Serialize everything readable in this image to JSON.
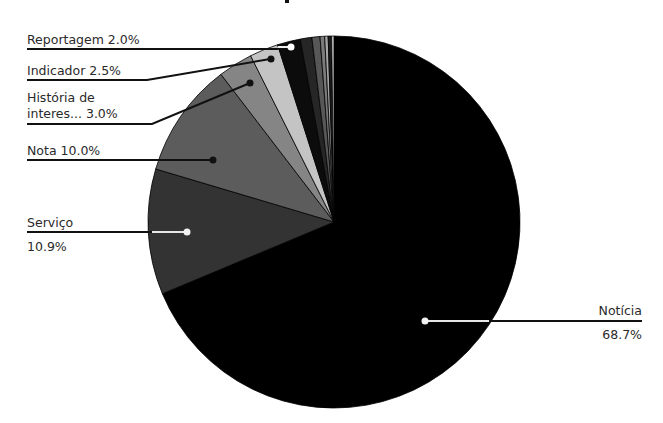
{
  "chart_data": {
    "type": "pie",
    "title": "",
    "start_angle_deg": 0,
    "direction": "clockwise",
    "center": [
      334,
      222
    ],
    "radius": 186,
    "slices": [
      {
        "label": "Notícia",
        "value": 68.7,
        "display": "68.7%",
        "color": "#000000",
        "show_label": true
      },
      {
        "label": "Serviço",
        "value": 10.9,
        "display": "10.9%",
        "color": "#333333",
        "show_label": true
      },
      {
        "label": "Nota",
        "value": 10.0,
        "display": "10.0%",
        "color": "#5c5c5c",
        "show_label": true
      },
      {
        "label": "História de interes...",
        "value": 3.0,
        "display": "3.0%",
        "color": "#858585",
        "show_label": true
      },
      {
        "label": "Indicador",
        "value": 2.5,
        "display": "2.5%",
        "color": "#c4c4c4",
        "show_label": true
      },
      {
        "label": "Reportagem",
        "value": 2.0,
        "display": "2.0%",
        "color": "#0c0c0c",
        "show_label": true
      },
      {
        "label": "",
        "value": 1.0,
        "display": "",
        "color": "#262626",
        "show_label": false
      },
      {
        "label": "",
        "value": 0.7,
        "display": "",
        "color": "#575757",
        "show_label": false
      },
      {
        "label": "",
        "value": 0.4,
        "display": "",
        "color": "#7a7a7a",
        "show_label": false
      },
      {
        "label": "",
        "value": 0.3,
        "display": "",
        "color": "#a6a6a6",
        "show_label": false
      },
      {
        "label": "",
        "value": 0.3,
        "display": "",
        "color": "#1a1a1a",
        "show_label": false
      },
      {
        "label": "",
        "value": 0.2,
        "display": "",
        "color": "#d9d9d9",
        "show_label": false
      }
    ],
    "legend": "none",
    "grid": false
  },
  "labels": {
    "reportagem": {
      "line1": "Reportagem 2.0%"
    },
    "indicador": {
      "line1": "Indicador 2.5%"
    },
    "historia": {
      "line1": "História de",
      "line2": "interes... 3.0%"
    },
    "nota": {
      "line1": "Nota 10.0%"
    },
    "servico": {
      "line1": "Serviço",
      "line2": "10.9%"
    },
    "noticia": {
      "line1": "Notícia",
      "line2": "68.7%"
    }
  }
}
